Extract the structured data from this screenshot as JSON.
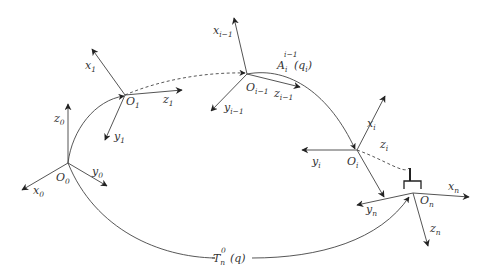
{
  "diagram": {
    "type": "kinematic-chain-coordinate-frames",
    "frames": [
      {
        "origin": "O",
        "origin_sub": "0",
        "x": "x",
        "x_sub": "0",
        "y": "y",
        "y_sub": "0",
        "z": "z",
        "z_sub": "0"
      },
      {
        "origin": "O",
        "origin_sub": "1",
        "x": "x",
        "x_sub": "1",
        "y": "y",
        "y_sub": "1",
        "z": "z",
        "z_sub": "1"
      },
      {
        "origin": "O",
        "origin_sub": "i−1",
        "x": "x",
        "x_sub": "i−1",
        "y": "y",
        "y_sub": "i−1",
        "z": "z",
        "z_sub": "i−1"
      },
      {
        "origin": "O",
        "origin_sub": "i",
        "x": "x",
        "x_sub": "i",
        "y": "y",
        "y_sub": "i",
        "z": "z",
        "z_sub": "i"
      },
      {
        "origin": "O",
        "origin_sub": "n",
        "x": "x",
        "x_sub": "n",
        "y": "y",
        "y_sub": "n",
        "z": "z",
        "z_sub": "n"
      }
    ],
    "transforms": {
      "link": {
        "symbol": "A",
        "sub": "i",
        "sup": "i−1",
        "arg": "(q",
        "arg_sub": "i",
        "arg_close": ")"
      },
      "total": {
        "symbol": "T",
        "sub": "n",
        "sup": "0",
        "arg": "(q)"
      }
    },
    "colors": {
      "lines": "#555555",
      "text": "#333333",
      "background": "#ffffff"
    }
  }
}
